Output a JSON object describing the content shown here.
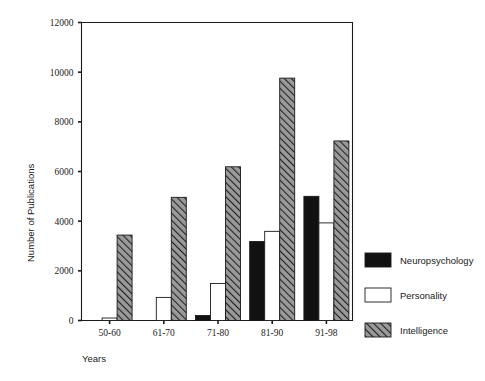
{
  "chart_data": {
    "type": "bar",
    "title": "",
    "subtitle": "",
    "xlabel": "Years",
    "ylabel": "Number of  Publications",
    "categories": [
      "50-60",
      "61-70",
      "71-80",
      "81-90",
      "91-98"
    ],
    "ylim": [
      0,
      12000
    ],
    "yticks": [
      0,
      2000,
      4000,
      6000,
      8000,
      10000,
      12000
    ],
    "ytick_labels": [
      "0",
      "2000",
      "4000",
      "6000",
      "8000",
      "10000",
      "12000"
    ],
    "grid": false,
    "legend_position": "right",
    "series": [
      {
        "name": "Neuropsychology",
        "fill": "solid-black",
        "color": "#111111",
        "values": [
          0,
          0,
          200,
          3180,
          5000
        ]
      },
      {
        "name": "Personality",
        "fill": "white-outline",
        "color": "#ffffff",
        "values": [
          100,
          930,
          1490,
          3590,
          3930
        ]
      },
      {
        "name": "Intelligence",
        "fill": "diagonal-hatch",
        "color": "#8c8c8c",
        "values": [
          3440,
          4960,
          6190,
          9760,
          7230
        ]
      }
    ]
  },
  "axis": {
    "y_title": "Number of  Publications",
    "x_title": "Years"
  },
  "legend": {
    "items": [
      {
        "label": "Neuropsychology",
        "swatch": "solid-black"
      },
      {
        "label": "Personality",
        "swatch": "white-outline"
      },
      {
        "label": "Intelligence",
        "swatch": "diagonal-hatch"
      }
    ]
  },
  "colors": {
    "axis": "#1a1a1a",
    "neuropsychology": "#111111",
    "personality": "#ffffff",
    "intelligence": "#8c8c8c",
    "background": "#ffffff"
  }
}
